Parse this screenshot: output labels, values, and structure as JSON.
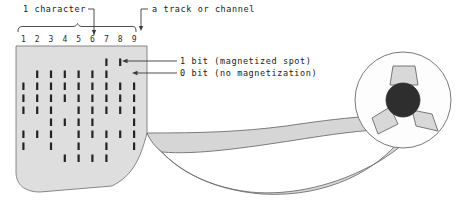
{
  "figure": {
    "title_label": "1 character",
    "track_label": "a track or channel",
    "one_bit_label": "1 bit (magnetized spot)",
    "zero_bit_label": "0 bit (no magnetization)",
    "column_numbers": [
      "1",
      "2",
      "3",
      "4",
      "5",
      "6",
      "7",
      "8",
      "9"
    ],
    "character_bracket_columns": [
      1,
      8
    ],
    "character_pointer_column": 6,
    "track_pointer_column": 9,
    "colors": {
      "tape_fill": "#dedede",
      "tape_stroke": "#7a7a7a",
      "bit_mark": "#232323",
      "reel_hub": "#2e2e2e",
      "reel_spoke": "#d8d8d8",
      "text": "#1a1a1a",
      "background": "#ffffff"
    },
    "bit_grid": {
      "rows": 9,
      "columns": 9,
      "description": "9-track magnetic tape bit pattern; 1 = magnetized spot, 0 = no magnetization",
      "matrix": [
        [
          0,
          0,
          0,
          0,
          0,
          0,
          0,
          1,
          1
        ],
        [
          0,
          1,
          1,
          1,
          1,
          1,
          1,
          0,
          0
        ],
        [
          1,
          1,
          1,
          1,
          1,
          1,
          1,
          1,
          1
        ],
        [
          1,
          1,
          1,
          1,
          1,
          1,
          1,
          1,
          1
        ],
        [
          1,
          1,
          1,
          0,
          1,
          1,
          1,
          1,
          1
        ],
        [
          0,
          0,
          1,
          1,
          1,
          1,
          0,
          0,
          1
        ],
        [
          1,
          1,
          1,
          0,
          1,
          1,
          1,
          1,
          1
        ],
        [
          1,
          0,
          1,
          0,
          1,
          0,
          1,
          0,
          1
        ],
        [
          0,
          0,
          0,
          1,
          1,
          1,
          1,
          0,
          0
        ]
      ]
    },
    "reel": {
      "spoke_count": 3,
      "hub_label": "reel-hub"
    }
  }
}
